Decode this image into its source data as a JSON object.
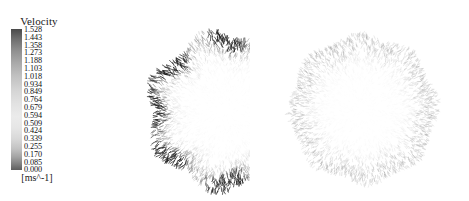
{
  "figure": {
    "kind": "velocity-vector-field",
    "panel_count": 2,
    "background": "#ffffff"
  },
  "legend": {
    "title": "Velocity",
    "units": "[ms^-1]",
    "orientation": "vertical",
    "colormap": "grayscale",
    "color_high": "#4a4a4a",
    "color_mid": "#ebebeb",
    "color_low": "#5e5e5e",
    "vmin": 0.0,
    "vmax": 1.528,
    "tick_labels": [
      "1.528",
      "1.443",
      "1.358",
      "1.273",
      "1.188",
      "1.103",
      "1.018",
      "0.934",
      "0.849",
      "0.764",
      "0.679",
      "0.594",
      "0.509",
      "0.424",
      "0.339",
      "0.255",
      "0.170",
      "0.085",
      "0.000"
    ],
    "tick_values": [
      1.528,
      1.443,
      1.358,
      1.273,
      1.188,
      1.103,
      1.018,
      0.934,
      0.849,
      0.764,
      0.679,
      0.594,
      0.509,
      0.424,
      0.339,
      0.255,
      0.17,
      0.085,
      0.0
    ]
  },
  "chart_data": {
    "type": "scatter",
    "title": "Velocity",
    "xlabel": "",
    "ylabel": "",
    "colorbar_label": "Velocity",
    "colorbar_units": "[ms^-1]",
    "vmin": 0.0,
    "vmax": 1.528,
    "grid": false,
    "legend_position": "left",
    "panels": [
      {
        "name": "left-velocity-field",
        "center_x": 157,
        "center_y": 103,
        "radius": 78,
        "lobes": 7,
        "lobe_amplitude": 0.07,
        "glyph_count": 2600,
        "description": "radial velocity vector field with seven dark high-velocity tufts on the rim",
        "hotspots": [
          {
            "angle_deg": 90,
            "radius_frac": 0.93,
            "intensity": 0.95
          },
          {
            "angle_deg": 141,
            "radius_frac": 0.95,
            "intensity": 0.8
          },
          {
            "angle_deg": 180,
            "radius_frac": 0.99,
            "intensity": 1.0
          },
          {
            "angle_deg": 219,
            "radius_frac": 0.95,
            "intensity": 0.88
          },
          {
            "angle_deg": 270,
            "radius_frac": 0.93,
            "intensity": 0.82
          },
          {
            "angle_deg": 321,
            "radius_frac": 0.95,
            "intensity": 0.85
          },
          {
            "angle_deg": 39,
            "radius_frac": 0.95,
            "intensity": 0.78
          }
        ]
      },
      {
        "name": "right-velocity-field",
        "center_x": 85,
        "center_y": 97,
        "radius": 74,
        "lobes": 8,
        "lobe_amplitude": 0.04,
        "glyph_count": 2600,
        "description": "radial velocity vector field with uniform low-velocity texture and no rim tufts",
        "hotspots": []
      }
    ]
  }
}
